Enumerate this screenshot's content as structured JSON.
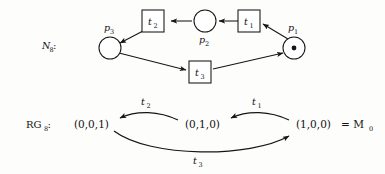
{
  "figure": {
    "net": {
      "caption": "N",
      "caption_sub": "8",
      "caption_colon": ":",
      "places": [
        {
          "id": "p1",
          "name": "p",
          "sub": "1",
          "tokens": 1,
          "token_glyph": "dot"
        },
        {
          "id": "p2",
          "name": "p",
          "sub": "2",
          "tokens": 0
        },
        {
          "id": "p3",
          "name": "p",
          "sub": "3",
          "tokens": 0
        }
      ],
      "transitions": [
        {
          "id": "t1",
          "name": "t",
          "sub": "1"
        },
        {
          "id": "t2",
          "name": "t",
          "sub": "2"
        },
        {
          "id": "t3",
          "name": "t",
          "sub": "3"
        }
      ],
      "arcs": [
        {
          "from": "p1",
          "to": "t1"
        },
        {
          "from": "t1",
          "to": "p2"
        },
        {
          "from": "p2",
          "to": "t2"
        },
        {
          "from": "t2",
          "to": "p3"
        },
        {
          "from": "p3",
          "to": "t3"
        },
        {
          "from": "t3",
          "to": "p1"
        }
      ]
    },
    "reachability_graph": {
      "caption": "RG",
      "caption_sub": "8",
      "caption_colon": ":",
      "states": [
        {
          "id": "s3",
          "marking": "(0,0,1)",
          "annotation": ""
        },
        {
          "id": "s2",
          "marking": "(0,1,0)",
          "annotation": ""
        },
        {
          "id": "s1",
          "marking": "(1,0,0)",
          "annotation": "= M",
          "annotation_sub": "0"
        }
      ],
      "edges": [
        {
          "from": "s1",
          "to": "s2",
          "label": "t",
          "label_sub": "1",
          "direction": "left",
          "curve": "top"
        },
        {
          "from": "s2",
          "to": "s3",
          "label": "t",
          "label_sub": "2",
          "direction": "left",
          "curve": "top"
        },
        {
          "from": "s3",
          "to": "s1",
          "label": "t",
          "label_sub": "3",
          "direction": "right",
          "curve": "bottom"
        }
      ]
    },
    "colors": {
      "ink": "#161616",
      "paper": "#fdfdfc"
    }
  }
}
